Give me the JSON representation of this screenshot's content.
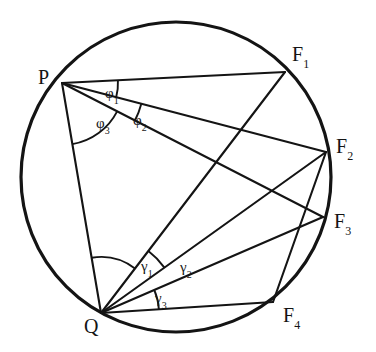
{
  "figure": {
    "background_color": "#ffffff",
    "stroke_color": "#141414",
    "circle": {
      "name": "circumscribed-circle",
      "cx": 176,
      "cy": 177,
      "r": 155,
      "stroke_width": 3.2
    },
    "points": [
      {
        "id": "P",
        "label": "P",
        "sub": "",
        "x": 62,
        "y": 83,
        "label_x": 38,
        "label_y": 67
      },
      {
        "id": "Q",
        "label": "Q",
        "sub": "",
        "x": 101,
        "y": 313,
        "label_x": 84,
        "label_y": 316
      },
      {
        "id": "F1",
        "label": "F",
        "sub": "1",
        "x": 285,
        "y": 72,
        "label_x": 292,
        "label_y": 44
      },
      {
        "id": "F2",
        "label": "F",
        "sub": "2",
        "x": 326,
        "y": 152,
        "label_x": 336,
        "label_y": 136
      },
      {
        "id": "F3",
        "label": "F",
        "sub": "3",
        "x": 323,
        "y": 217,
        "label_x": 334,
        "label_y": 211
      },
      {
        "id": "F4",
        "label": "F",
        "sub": "4",
        "x": 273,
        "y": 302,
        "label_x": 283,
        "label_y": 305
      }
    ],
    "chords": [
      {
        "name": "chord-P-F1",
        "from": "P",
        "to": "F1"
      },
      {
        "name": "chord-P-F2",
        "from": "P",
        "to": "F2"
      },
      {
        "name": "chord-P-F3",
        "from": "P",
        "to": "F3"
      },
      {
        "name": "chord-P-Q",
        "from": "P",
        "to": "Q"
      },
      {
        "name": "chord-Q-F1",
        "from": "Q",
        "to": "F1"
      },
      {
        "name": "chord-Q-F2",
        "from": "Q",
        "to": "F2"
      },
      {
        "name": "chord-Q-F3",
        "from": "Q",
        "to": "F3"
      },
      {
        "name": "chord-Q-F4",
        "from": "Q",
        "to": "F4"
      },
      {
        "name": "chord-F4-F2",
        "from": "F4",
        "to": "F2"
      }
    ],
    "angles": [
      {
        "id": "phi1",
        "label": "φ",
        "sub": "1",
        "vertex": "P",
        "from": "F1",
        "to": "F2",
        "arc_radius": 56,
        "label_x": 105,
        "label_y": 86
      },
      {
        "id": "phi2",
        "label": "φ",
        "sub": "2",
        "vertex": "P",
        "from": "F2",
        "to": "F3",
        "arc_radius": 82,
        "label_x": 133,
        "label_y": 113
      },
      {
        "id": "phi3",
        "label": "φ",
        "sub": "3",
        "vertex": "P",
        "from": "F3",
        "to": "Q",
        "arc_radius": 62,
        "label_x": 96,
        "label_y": 116
      },
      {
        "id": "gamma1",
        "label": "γ",
        "sub": "1",
        "vertex": "Q",
        "from": "P",
        "to": "F1",
        "arc_radius": 56,
        "label_x": 141,
        "label_y": 259
      },
      {
        "id": "gamma2",
        "label": "γ",
        "sub": "2",
        "vertex": "Q",
        "from": "F1",
        "to": "F2",
        "arc_radius": 78,
        "label_x": 180,
        "label_y": 260
      },
      {
        "id": "gamma3",
        "label": "γ",
        "sub": "3",
        "vertex": "Q",
        "from": "F3",
        "to": "F4",
        "arc_radius": 58,
        "label_x": 155,
        "label_y": 291
      }
    ]
  }
}
